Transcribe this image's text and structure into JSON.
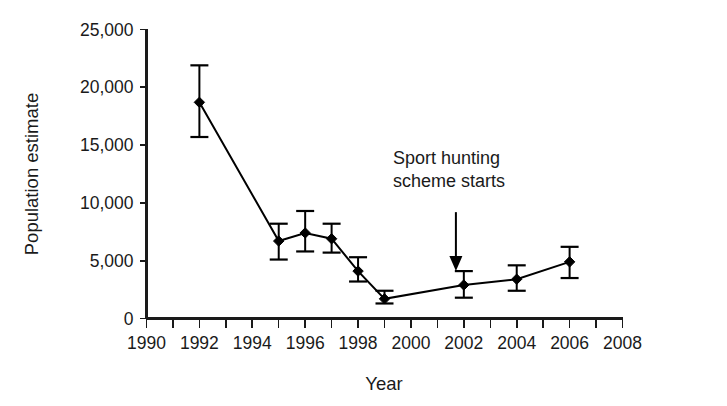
{
  "chart_data": {
    "type": "line",
    "title": "",
    "xlabel": "Year",
    "ylabel": "Population estimate",
    "xlim": [
      1990,
      2008
    ],
    "ylim": [
      0,
      25000
    ],
    "grid": false,
    "legend": "none",
    "x_tick_labels": [
      "1990",
      "1992",
      "1994",
      "1996",
      "1998",
      "2000",
      "2002",
      "2004",
      "2006",
      "2008"
    ],
    "x_tick_values": [
      1990,
      1992,
      1994,
      1996,
      1998,
      2000,
      2002,
      2004,
      2006,
      2008
    ],
    "x_minor_tick_values": [
      1991,
      1993,
      1995,
      1997,
      1999,
      2001,
      2003,
      2005,
      2007
    ],
    "y_tick_labels": [
      "0",
      "5,000",
      "10,000",
      "15,000",
      "20,000",
      "25,000"
    ],
    "y_tick_values": [
      0,
      5000,
      10000,
      15000,
      20000,
      25000
    ],
    "x": [
      1992,
      1995,
      1996,
      1997,
      1998,
      1999,
      2002,
      2004,
      2006
    ],
    "values": [
      18700,
      6700,
      7400,
      6900,
      4100,
      1700,
      2900,
      3400,
      4900
    ],
    "error_upper": [
      21900,
      8200,
      9300,
      8200,
      5300,
      2400,
      4100,
      4600,
      6200
    ],
    "error_lower": [
      15700,
      5100,
      5800,
      5700,
      3200,
      1300,
      1800,
      2400,
      3500
    ],
    "marker": "diamond",
    "marker_color": "#000000",
    "line_color": "#000000",
    "annotations": [
      {
        "name": "sport-hunting-annotation",
        "line1": "Sport hunting",
        "line2": "scheme starts",
        "arrow_x": 2001.7,
        "arrow_from_y": 9200,
        "arrow_to_y": 4100
      }
    ]
  },
  "colors": {
    "background": "#ffffff",
    "ink": "#1a1a1a",
    "data": "#000000"
  }
}
